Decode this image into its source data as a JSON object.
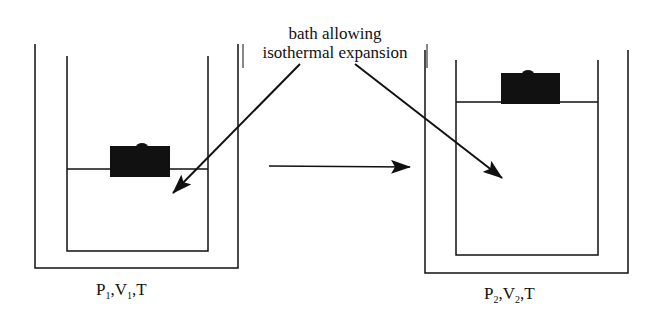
{
  "diagram": {
    "annotation": {
      "line1": "bath allowing",
      "line2": "isothermal expansion"
    },
    "initial_state": {
      "P": "P",
      "P_sub": "1",
      "V": "V",
      "V_sub": "1",
      "T": "T"
    },
    "final_state": {
      "P": "P",
      "P_sub": "2",
      "V": "V",
      "V_sub": "2",
      "T": "T"
    },
    "colors": {
      "ink": "#111111",
      "background": "#ffffff"
    }
  }
}
